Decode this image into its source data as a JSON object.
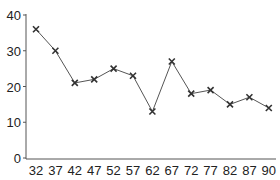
{
  "chart_data": {
    "type": "line",
    "title": "",
    "xlabel": "",
    "ylabel": "",
    "categories": [
      "32",
      "37",
      "42",
      "47",
      "52",
      "57",
      "62",
      "67",
      "72",
      "77",
      "82",
      "87",
      "90"
    ],
    "series": [
      {
        "name": "series-1",
        "values": [
          36,
          30,
          21,
          22,
          25,
          23,
          13,
          27,
          18,
          19,
          15,
          17,
          14
        ],
        "marker": "x",
        "color": "#333333"
      }
    ],
    "yticks": [
      0,
      10,
      20,
      30,
      40
    ],
    "ylim": [
      0,
      40
    ],
    "grid": false,
    "legend": null
  }
}
